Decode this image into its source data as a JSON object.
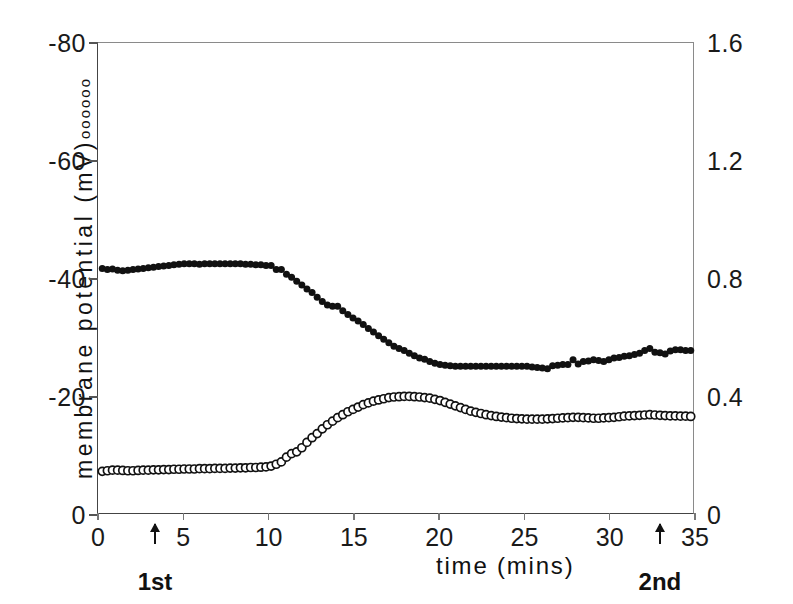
{
  "chart_data": {
    "type": "scatter",
    "title": "",
    "xlabel": "time (mins)",
    "ylabel_left": "membrane potential (mV)",
    "ylabel_right": "membrane resistance (MΩ)",
    "left_legend_marker": "oooooo",
    "right_legend_marker": "••••••",
    "xlim": [
      0,
      35
    ],
    "xticks": [
      0,
      5,
      10,
      15,
      20,
      25,
      30,
      35
    ],
    "xticklabels": [
      "0",
      "5",
      "10",
      "15",
      "20",
      "25",
      "30",
      "35"
    ],
    "ylim_left": [
      0,
      -80
    ],
    "yticks_left": [
      0,
      -20,
      -40,
      -60,
      -80
    ],
    "yticklabels_left": [
      "0",
      "-20",
      "-40",
      "-60",
      "-80"
    ],
    "ylim_right": [
      0,
      1.6
    ],
    "yticks_right": [
      0,
      0.4,
      0.8,
      1.2,
      1.6
    ],
    "yticklabels_right": [
      "0",
      "0.4",
      "0.8",
      "1.2",
      "1.6"
    ],
    "grid": false,
    "legend_position": "axis-labels",
    "annotations": [
      {
        "label": "1st",
        "x": 3.4,
        "type": "arrow-up"
      },
      {
        "label": "2nd",
        "x": 33.0,
        "type": "arrow-up"
      }
    ],
    "series": [
      {
        "name": "membrane potential (mV)",
        "axis": "left",
        "marker": "filled-circle",
        "color": "#111111",
        "x": [
          0.25,
          0.55,
          0.85,
          1.15,
          1.45,
          1.75,
          2.05,
          2.35,
          2.65,
          2.95,
          3.25,
          3.55,
          3.85,
          4.15,
          4.45,
          4.75,
          5.05,
          5.35,
          5.65,
          5.95,
          6.25,
          6.55,
          6.85,
          7.15,
          7.45,
          7.75,
          8.05,
          8.35,
          8.65,
          8.95,
          9.25,
          9.55,
          9.85,
          10.15,
          10.45,
          10.75,
          11.05,
          11.35,
          11.65,
          11.95,
          12.25,
          12.55,
          12.85,
          13.15,
          13.45,
          13.75,
          14.05,
          14.35,
          14.65,
          14.95,
          15.25,
          15.55,
          15.85,
          16.15,
          16.45,
          16.75,
          17.05,
          17.35,
          17.65,
          17.95,
          18.25,
          18.55,
          18.85,
          19.15,
          19.45,
          19.75,
          20.05,
          20.35,
          20.65,
          20.95,
          21.25,
          21.55,
          21.85,
          22.15,
          22.45,
          22.75,
          23.05,
          23.35,
          23.65,
          23.95,
          24.25,
          24.55,
          24.85,
          25.15,
          25.45,
          25.75,
          26.05,
          26.35,
          26.65,
          26.95,
          27.25,
          27.55,
          27.85,
          28.15,
          28.45,
          28.75,
          29.05,
          29.35,
          29.65,
          29.95,
          30.25,
          30.55,
          30.85,
          31.15,
          31.45,
          31.75,
          32.05,
          32.35,
          32.65,
          32.95,
          33.25,
          33.55,
          33.85,
          34.15,
          34.45,
          34.75
        ],
        "y": [
          -41.8,
          -41.6,
          -41.7,
          -41.5,
          -41.4,
          -41.5,
          -41.6,
          -41.7,
          -41.8,
          -41.9,
          -42.0,
          -42.1,
          -42.2,
          -42.3,
          -42.4,
          -42.5,
          -42.6,
          -42.6,
          -42.6,
          -42.5,
          -42.6,
          -42.6,
          -42.6,
          -42.6,
          -42.6,
          -42.6,
          -42.6,
          -42.6,
          -42.5,
          -42.5,
          -42.4,
          -42.4,
          -42.3,
          -42.3,
          -41.6,
          -41.6,
          -40.8,
          -40.3,
          -39.6,
          -39.0,
          -38.3,
          -37.7,
          -36.9,
          -36.2,
          -35.6,
          -35.4,
          -35.4,
          -34.6,
          -34.0,
          -33.4,
          -32.9,
          -32.3,
          -31.6,
          -31.0,
          -30.4,
          -29.8,
          -29.2,
          -28.6,
          -28.2,
          -27.9,
          -27.4,
          -27.0,
          -26.6,
          -26.4,
          -26.0,
          -25.7,
          -25.5,
          -25.4,
          -25.3,
          -25.2,
          -25.2,
          -25.2,
          -25.2,
          -25.2,
          -25.2,
          -25.2,
          -25.2,
          -25.2,
          -25.2,
          -25.2,
          -25.2,
          -25.2,
          -25.2,
          -25.2,
          -25.1,
          -25.0,
          -24.9,
          -24.8,
          -25.3,
          -25.4,
          -25.5,
          -25.5,
          -26.3,
          -25.6,
          -26.0,
          -26.1,
          -26.3,
          -26.2,
          -26.0,
          -26.3,
          -26.6,
          -26.7,
          -26.9,
          -27.0,
          -27.2,
          -27.4,
          -27.9,
          -28.2,
          -27.6,
          -27.5,
          -27.3,
          -27.8,
          -28.0,
          -28.0,
          -27.9,
          -27.9
        ]
      },
      {
        "name": "membrane resistance (MΩ)",
        "axis": "right",
        "marker": "open-circle",
        "color": "#111111",
        "x": [
          0.25,
          0.55,
          0.85,
          1.15,
          1.45,
          1.75,
          2.05,
          2.35,
          2.65,
          2.95,
          3.25,
          3.55,
          3.85,
          4.15,
          4.45,
          4.75,
          5.05,
          5.35,
          5.65,
          5.95,
          6.25,
          6.55,
          6.85,
          7.15,
          7.45,
          7.75,
          8.05,
          8.35,
          8.65,
          8.95,
          9.25,
          9.55,
          9.85,
          10.15,
          10.45,
          10.75,
          11.05,
          11.35,
          11.65,
          11.95,
          12.25,
          12.55,
          12.85,
          13.15,
          13.45,
          13.75,
          14.05,
          14.35,
          14.65,
          14.95,
          15.25,
          15.55,
          15.85,
          16.15,
          16.45,
          16.75,
          17.05,
          17.35,
          17.65,
          17.95,
          18.25,
          18.55,
          18.85,
          19.15,
          19.45,
          19.75,
          20.05,
          20.35,
          20.65,
          20.95,
          21.25,
          21.55,
          21.85,
          22.15,
          22.45,
          22.75,
          23.05,
          23.35,
          23.65,
          23.95,
          24.25,
          24.55,
          24.85,
          25.15,
          25.45,
          25.75,
          26.05,
          26.35,
          26.65,
          26.95,
          27.25,
          27.55,
          27.85,
          28.15,
          28.45,
          28.75,
          29.05,
          29.35,
          29.65,
          29.95,
          30.25,
          30.55,
          30.85,
          31.15,
          31.45,
          31.75,
          32.05,
          32.35,
          32.65,
          32.95,
          33.25,
          33.55,
          33.85,
          34.15,
          34.45,
          34.75
        ],
        "y": [
          0.148,
          0.15,
          0.152,
          0.152,
          0.151,
          0.15,
          0.15,
          0.151,
          0.152,
          0.152,
          0.153,
          0.153,
          0.154,
          0.154,
          0.155,
          0.155,
          0.156,
          0.156,
          0.156,
          0.157,
          0.157,
          0.157,
          0.158,
          0.158,
          0.158,
          0.159,
          0.159,
          0.16,
          0.16,
          0.161,
          0.161,
          0.162,
          0.163,
          0.166,
          0.172,
          0.18,
          0.196,
          0.208,
          0.214,
          0.228,
          0.246,
          0.262,
          0.276,
          0.292,
          0.306,
          0.318,
          0.33,
          0.34,
          0.35,
          0.358,
          0.366,
          0.374,
          0.38,
          0.386,
          0.39,
          0.394,
          0.398,
          0.4,
          0.401,
          0.402,
          0.402,
          0.401,
          0.4,
          0.398,
          0.396,
          0.392,
          0.388,
          0.382,
          0.376,
          0.37,
          0.364,
          0.358,
          0.352,
          0.348,
          0.344,
          0.34,
          0.337,
          0.334,
          0.332,
          0.33,
          0.328,
          0.327,
          0.326,
          0.325,
          0.325,
          0.325,
          0.325,
          0.326,
          0.327,
          0.328,
          0.329,
          0.33,
          0.331,
          0.331,
          0.33,
          0.329,
          0.328,
          0.328,
          0.329,
          0.33,
          0.331,
          0.333,
          0.335,
          0.336,
          0.337,
          0.338,
          0.339,
          0.34,
          0.339,
          0.338,
          0.337,
          0.336,
          0.336,
          0.335,
          0.335,
          0.334
        ]
      }
    ]
  }
}
